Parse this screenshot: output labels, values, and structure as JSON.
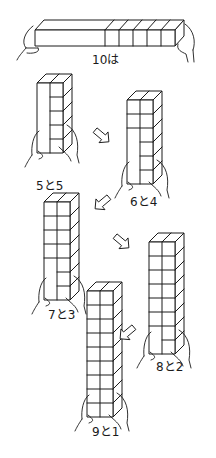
{
  "figure": {
    "title_label": "10は",
    "top_bar": {
      "total_cells": 10,
      "visible_cell_dividers_right": 5,
      "x": 35,
      "y": 30,
      "w": 140,
      "h": 16,
      "depth_dx": 9,
      "depth_dy": -10,
      "label_x": 92,
      "label_y": 64
    },
    "columns": [
      {
        "id": "col-5-5",
        "label": "5と5",
        "left": 5,
        "right": 5,
        "x": 37,
        "y": 83,
        "cell_w": 13,
        "cell_h": 14,
        "cells": 5,
        "label_x": 36,
        "label_y": 190,
        "held": "bottom"
      },
      {
        "id": "col-6-4",
        "label": "6と4",
        "left": 6,
        "right": 4,
        "x": 127,
        "y": 100,
        "cell_w": 13,
        "cell_h": 14,
        "cells": 6,
        "label_x": 130,
        "label_y": 206,
        "held": "bottom"
      },
      {
        "id": "col-7-3",
        "label": "7と3",
        "left": 7,
        "right": 3,
        "x": 44,
        "y": 202,
        "cell_w": 13,
        "cell_h": 14,
        "cells": 7,
        "label_x": 48,
        "label_y": 319,
        "held": "bottom"
      },
      {
        "id": "col-8-2",
        "label": "8と2",
        "left": 8,
        "right": 2,
        "x": 149,
        "y": 242,
        "cell_w": 13,
        "cell_h": 14,
        "cells": 8,
        "label_x": 156,
        "label_y": 371,
        "held": "bottom"
      },
      {
        "id": "col-9-1",
        "label": "9と1",
        "left": 9,
        "right": 1,
        "x": 87,
        "y": 291,
        "cell_w": 13,
        "cell_h": 14,
        "cells": 9,
        "label_x": 92,
        "label_y": 436,
        "held": "bottom"
      }
    ],
    "arrows": [
      {
        "id": "arrow-1",
        "direction": "down-right",
        "x": 102,
        "y": 136
      },
      {
        "id": "arrow-2",
        "direction": "down-left",
        "x": 102,
        "y": 203
      },
      {
        "id": "arrow-3",
        "direction": "down-right",
        "x": 122,
        "y": 242
      },
      {
        "id": "arrow-4",
        "direction": "down-left",
        "x": 127,
        "y": 333
      }
    ],
    "colors": {
      "ink": "#1a1a1a",
      "paper": "#ffffff"
    }
  }
}
